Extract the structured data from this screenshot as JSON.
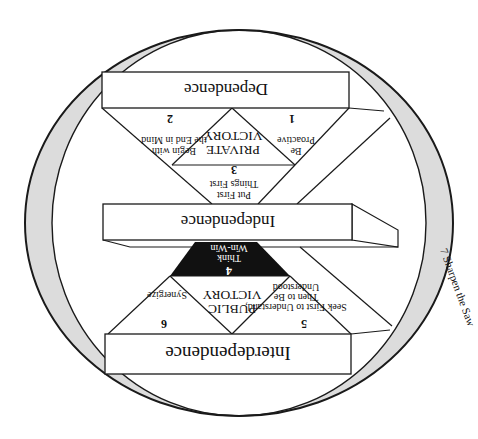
{
  "diagram": {
    "orientation": "rotated 180 degrees",
    "colors": {
      "ring": "#dcdcdc",
      "lines": "#1a1a1a",
      "think_win_win_fill": "#111111",
      "background": "#ffffff"
    },
    "levels": {
      "dependence": "Dependence",
      "independence": "Independence",
      "interdependence": "Interdependence"
    },
    "victories": {
      "private": [
        "PRIVATE",
        "VICTORY"
      ],
      "public": [
        "PUBLIC",
        "VICTORY"
      ]
    },
    "habits": [
      {
        "number": "1",
        "lines": [
          "Be",
          "Proactive"
        ]
      },
      {
        "number": "2",
        "lines": [
          "Begin with",
          "the End in Mind"
        ]
      },
      {
        "number": "3",
        "lines": [
          "Put First",
          "Things First"
        ]
      },
      {
        "number": "4",
        "lines": [
          "Think",
          "Win-Win"
        ]
      },
      {
        "number": "5",
        "lines": [
          "Seek First to Understand,",
          "Then to Be",
          "Understood"
        ]
      },
      {
        "number": "6",
        "lines": [
          "Synergize"
        ]
      },
      {
        "number": "7",
        "lines": [
          "Sharpen the Saw"
        ]
      }
    ],
    "ring_label": "7 Sharpen the Saw"
  }
}
